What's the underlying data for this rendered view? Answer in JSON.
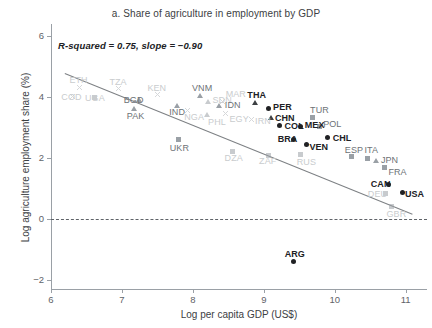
{
  "chart_data": {
    "type": "scatter",
    "title": "a. Share of agriculture in employment by GDP",
    "xlabel": "Log per capita GDP (US$)",
    "ylabel": "Log agriculture employment share (%)",
    "annotation": "R-squared = 0.75, slope = −0.90",
    "r_squared": 0.75,
    "slope": -0.9,
    "xlim": [
      6,
      11.3
    ],
    "ylim": [
      -2.3,
      6.4
    ],
    "xticks": [
      "6",
      "7",
      "8",
      "9",
      "10",
      "11"
    ],
    "xtick_values": [
      6,
      7,
      8,
      9,
      10,
      11
    ],
    "yticks": [
      "6",
      "4",
      "2",
      "0",
      "−2"
    ],
    "ytick_values": [
      6,
      4,
      2,
      0,
      -2
    ],
    "grid": false,
    "legend": "none",
    "reference_lines": [
      {
        "name": "zero-line",
        "orientation": "horizontal",
        "y": 0,
        "style": "dashed"
      },
      {
        "name": "regression-line",
        "style": "solid",
        "x0": 6.2,
        "y0": 4.78,
        "x1": 11.1,
        "y1": 0.16
      }
    ],
    "points": [
      {
        "code": "ETH",
        "x": 6.4,
        "y": 4.32,
        "marker": "x",
        "emphasis": "faint"
      },
      {
        "code": "COD",
        "x": 6.3,
        "y": 4.02,
        "marker": "x",
        "emphasis": "faint"
      },
      {
        "code": "UGA",
        "x": 6.62,
        "y": 4.0,
        "marker": "square",
        "emphasis": "faint"
      },
      {
        "code": "TZA",
        "x": 6.95,
        "y": 4.28,
        "marker": "x",
        "emphasis": "faint"
      },
      {
        "code": "BGD",
        "x": 7.25,
        "y": 3.92,
        "marker": "triangle",
        "emphasis": "mid"
      },
      {
        "code": "PAK",
        "x": 7.18,
        "y": 3.62,
        "marker": "triangle",
        "emphasis": "mid"
      },
      {
        "code": "KEN",
        "x": 7.5,
        "y": 4.08,
        "marker": "x",
        "emphasis": "faint"
      },
      {
        "code": "IND",
        "x": 7.78,
        "y": 3.72,
        "marker": "triangle",
        "emphasis": "mid"
      },
      {
        "code": "NGA",
        "x": 7.92,
        "y": 3.56,
        "marker": "x",
        "emphasis": "faint"
      },
      {
        "code": "VNM",
        "x": 8.1,
        "y": 4.02,
        "marker": "triangle",
        "emphasis": "mid"
      },
      {
        "code": "SDN",
        "x": 8.22,
        "y": 3.84,
        "marker": "triangle",
        "emphasis": "faint"
      },
      {
        "code": "MAR",
        "x": 8.42,
        "y": 3.86,
        "marker": "x",
        "emphasis": "faint"
      },
      {
        "code": "IDN",
        "x": 8.38,
        "y": 3.7,
        "marker": "triangle",
        "emphasis": "mid"
      },
      {
        "code": "PHL",
        "x": 8.2,
        "y": 3.4,
        "marker": "triangle",
        "emphasis": "faint"
      },
      {
        "code": "EGY",
        "x": 8.46,
        "y": 3.46,
        "marker": "x",
        "emphasis": "faint"
      },
      {
        "code": "UKR",
        "x": 7.8,
        "y": 2.6,
        "marker": "square",
        "emphasis": "mid"
      },
      {
        "code": "IRN",
        "x": 8.82,
        "y": 3.28,
        "marker": "x",
        "emphasis": "faint"
      },
      {
        "code": "THA",
        "x": 8.88,
        "y": 3.8,
        "marker": "triangle",
        "emphasis": "dark"
      },
      {
        "code": "PER",
        "x": 9.06,
        "y": 3.62,
        "marker": "circle",
        "emphasis": "dark"
      },
      {
        "code": "CHN",
        "x": 9.1,
        "y": 3.32,
        "marker": "triangle",
        "emphasis": "dark"
      },
      {
        "code": "COL",
        "x": 9.22,
        "y": 3.06,
        "marker": "circle",
        "emphasis": "dark"
      },
      {
        "code": "MEX",
        "x": 9.52,
        "y": 3.04,
        "marker": "circle",
        "emphasis": "dark"
      },
      {
        "code": "TUR",
        "x": 9.68,
        "y": 3.32,
        "marker": "square",
        "emphasis": "mid"
      },
      {
        "code": "POL",
        "x": 9.78,
        "y": 3.02,
        "marker": "square",
        "emphasis": "mid"
      },
      {
        "code": "BRA",
        "x": 9.42,
        "y": 2.62,
        "marker": "circle",
        "emphasis": "dark"
      },
      {
        "code": "CHL",
        "x": 9.9,
        "y": 2.66,
        "marker": "circle",
        "emphasis": "dark"
      },
      {
        "code": "VEN",
        "x": 9.6,
        "y": 2.44,
        "marker": "circle",
        "emphasis": "dark"
      },
      {
        "code": "DZA",
        "x": 8.56,
        "y": 2.22,
        "marker": "square",
        "emphasis": "faint"
      },
      {
        "code": "ZAF",
        "x": 9.06,
        "y": 2.08,
        "marker": "square",
        "emphasis": "faint"
      },
      {
        "code": "RUS",
        "x": 9.52,
        "y": 2.1,
        "marker": "square",
        "emphasis": "faint"
      },
      {
        "code": "ESP",
        "x": 10.24,
        "y": 2.04,
        "marker": "square",
        "emphasis": "mid"
      },
      {
        "code": "ITA",
        "x": 10.46,
        "y": 2.0,
        "marker": "square",
        "emphasis": "mid"
      },
      {
        "code": "JPN",
        "x": 10.58,
        "y": 1.9,
        "marker": "triangle",
        "emphasis": "mid"
      },
      {
        "code": "FRA",
        "x": 10.7,
        "y": 1.7,
        "marker": "square",
        "emphasis": "mid"
      },
      {
        "code": "CAN",
        "x": 10.76,
        "y": 1.12,
        "marker": "circle",
        "emphasis": "dark"
      },
      {
        "code": "DEU",
        "x": 10.72,
        "y": 0.82,
        "marker": "square",
        "emphasis": "faint"
      },
      {
        "code": "USA",
        "x": 10.96,
        "y": 0.88,
        "marker": "circle",
        "emphasis": "dark"
      },
      {
        "code": "GBR",
        "x": 10.8,
        "y": 0.4,
        "marker": "square",
        "emphasis": "faint"
      },
      {
        "code": "ARG",
        "x": 9.42,
        "y": -1.4,
        "marker": "circle",
        "emphasis": "dark"
      }
    ]
  },
  "colors": {
    "dark": "#202124",
    "mid": "#6d7276",
    "faint": "#c9ccce",
    "line": "#7d8084",
    "axis": "#9aa0a6"
  }
}
